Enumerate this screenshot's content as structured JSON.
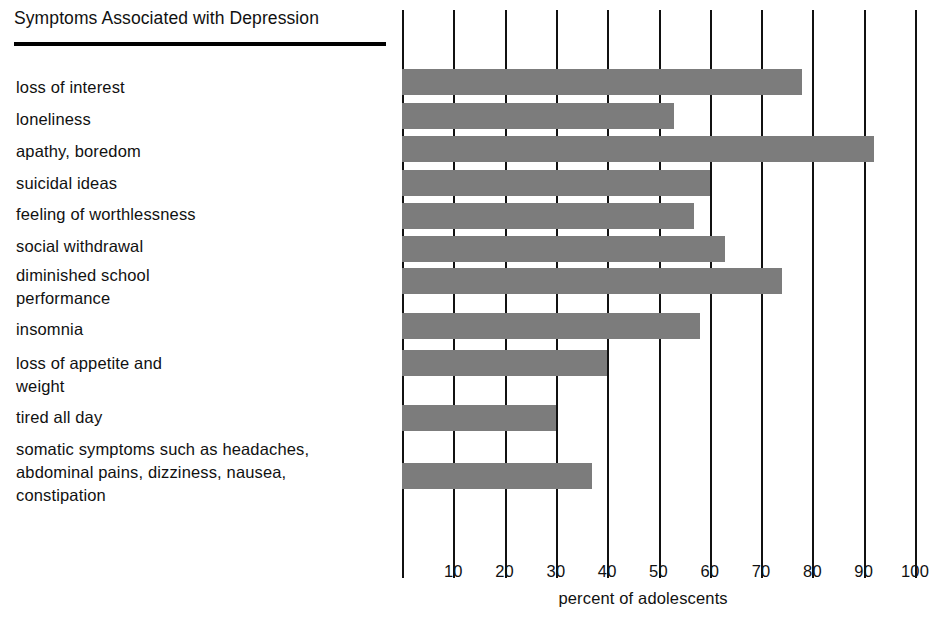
{
  "chart_data": {
    "type": "bar",
    "orientation": "horizontal",
    "title": "Symptoms Associated with Depression",
    "xlabel": "percent of adolescents",
    "ylabel": "",
    "xlim": [
      0,
      100
    ],
    "xticks": [
      10,
      20,
      30,
      40,
      50,
      60,
      70,
      80,
      90,
      100
    ],
    "xtick_labels": [
      "10",
      "20",
      "30",
      "40",
      "50",
      "60",
      "70",
      "80",
      "90",
      "100"
    ],
    "grid": true,
    "grid_axis": "x",
    "legend": null,
    "bar_color": "#7c7c7c",
    "categories": [
      "loss of interest",
      "loneliness",
      "apathy, boredom",
      "suicidal ideas",
      "feeling of worthlessness",
      "social withdrawal",
      "diminished school\nperformance",
      "insomnia",
      "loss of appetite and\nweight",
      "tired all day",
      "somatic symptoms such as headaches,\nabdominal pains, dizziness, nausea,\nconstipation"
    ],
    "values": [
      78,
      53,
      92,
      60,
      57,
      63,
      74,
      58,
      40,
      30,
      37
    ]
  },
  "axis": {
    "title_label": "percent of adolescents"
  }
}
